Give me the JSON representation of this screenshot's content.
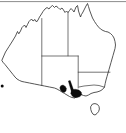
{
  "figure": {
    "kind": "distribution-map",
    "region_name": "Australia",
    "background_color": "#ffffff",
    "outline_color": "#2b2b2b",
    "border_color": "#3a3a3a",
    "occurrence_color": "#0a0a0a",
    "frame_color": "#5a5a5a",
    "width_px": 126,
    "height_px": 133,
    "caption": "",
    "title": "",
    "legend": ""
  },
  "frame": {
    "top_rule_y": 1.6,
    "top_rule_x1": 0,
    "top_rule_x2": 126
  },
  "mainland": {
    "name": "Australia mainland",
    "path": "M 2.0 60.0 L 5.5 52.0 L 9.0 46.5 L 12.5 41.0 L 15.5 36.0 L 17.5 31.5 L 18.8 33.8 L 20.5 31.0 L 22.0 27.5 L 24.5 25.0 L 26.0 27.5 L 27.5 24.5 L 29.0 21.5 L 31.5 19.0 L 33.0 21.0 L 35.0 19.5 L 36.5 22.0 L 38.0 20.0 L 39.5 17.0 L 41.5 14.0 L 43.0 11.5 L 45.0 9.0 L 47.0 7.5 L 49.0 9.0 L 50.5 7.0 L 52.5 5.5 L 54.5 7.5 L 56.0 6.0 L 58.0 7.5 L 60.0 9.5 L 62.0 8.0 L 63.5 10.0 L 65.0 12.5 L 66.5 11.0 L 68.0 12.5 L 69.5 10.5 L 71.0 8.5 L 72.5 10.0 L 74.0 12.0 L 75.0 9.5 L 76.0 7.0 L 77.5 5.5 L 78.0 8.0 L 78.5 11.0 L 79.5 14.0 L 80.5 17.0 L 81.5 14.5 L 83.0 12.0 L 84.5 9.0 L 86.0 6.0 L 87.5 3.5 L 88.5 6.5 L 89.5 10.0 L 91.0 14.0 L 92.5 18.0 L 94.5 21.5 L 96.5 24.5 L 98.5 27.0 L 100.5 29.0 L 103.0 30.5 L 105.5 31.5 L 108.0 32.0 L 110.5 33.5 L 112.5 35.5 L 114.0 38.0 L 115.0 41.5 L 115.5 45.0 L 115.0 48.5 L 114.0 52.0 L 113.0 55.5 L 112.0 59.0 L 111.0 62.5 L 110.0 66.0 L 109.0 69.5 L 108.0 73.0 L 107.0 76.5 L 106.0 80.0 L 105.2 83.5 L 104.5 87.0 L 102.5 89.5 L 100.0 91.0 L 97.0 92.0 L 94.0 92.5 L 91.0 93.5 L 88.5 95.0 L 86.0 96.0 L 83.5 95.5 L 81.0 94.5 L 78.5 95.5 L 76.5 97.0 L 74.5 98.0 L 72.0 97.5 L 69.5 96.5 L 67.0 95.0 L 64.5 93.5 L 62.0 92.0 L 59.5 90.5 L 57.0 89.0 L 54.5 88.0 L 52.0 87.5 L 49.5 87.0 L 47.0 86.5 L 44.5 86.0 L 42.0 85.5 L 39.5 85.0 L 37.0 84.5 L 34.5 84.0 L 32.0 83.5 L 29.5 83.0 L 27.0 82.5 L 24.5 82.0 L 22.0 81.5 L 19.5 80.5 L 17.0 79.0 L 15.0 77.0 L 13.0 74.5 L 11.0 72.0 L 9.0 69.5 L 7.0 67.0 L 5.0 64.5 L 3.2 62.5 Z"
  },
  "state_borders": [
    {
      "name": "wa-nt-sa-western-border",
      "path": "M 41.8 18.5 L 41.8 56.0 L 41.8 85.6"
    },
    {
      "name": "nt-qld-border",
      "path": "M 68.0 12.3 L 68.0 55.8"
    },
    {
      "name": "nt-sa-northern-border",
      "path": "M 41.8 56.0 L 78.2 56.0"
    },
    {
      "name": "sa-qld-nsw-eastern-border",
      "path": "M 78.2 56.0 L 78.2 88.0"
    },
    {
      "name": "qld-nsw-border",
      "path": "M 78.2 72.2 L 110.0 72.2"
    },
    {
      "name": "nsw-vic-border",
      "path": "M 79.0 87.0 L 84.0 86.0 L 89.0 85.5 L 94.0 85.0 L 99.0 85.5 L 104.5 87.2"
    }
  ],
  "islands": [
    {
      "name": "Tasmania",
      "path": "M 92.5 104.0 L 95.0 103.6 L 97.5 104.4 L 99.0 106.5 L 99.4 109.0 L 98.6 111.5 L 97.0 113.5 L 95.0 115.0 L 93.0 114.2 L 91.6 112.0 L 90.8 109.5 L 90.6 106.8 Z"
    }
  ],
  "occurrences": {
    "label": "recorded distribution",
    "shapes": [
      {
        "name": "eyre-peninsula-patch",
        "path": "M 60.8 85.8 L 63.0 85.0 L 65.2 86.4 L 66.4 88.6 L 66.0 91.0 L 64.2 92.4 L 62.0 91.8 L 60.4 90.0 L 59.9 87.8 Z"
      },
      {
        "name": "flinders-ranges-band",
        "path": "M 68.4 81.0 L 70.2 80.6 L 73.2 89.0 L 75.0 94.4 L 72.6 94.8 L 70.6 88.8 Z"
      },
      {
        "name": "yorke-fleurieu-patch",
        "path": "M 71.6 90.0 L 75.0 89.2 L 78.8 90.0 L 81.2 92.0 L 81.6 94.6 L 80.0 96.6 L 77.0 97.6 L 74.2 97.4 L 72.0 95.8 L 70.8 93.4 Z"
      }
    ],
    "dots": [
      {
        "name": "western-outlier-dot",
        "cx": 2.2,
        "cy": 86.0,
        "r": 1.5
      }
    ]
  }
}
